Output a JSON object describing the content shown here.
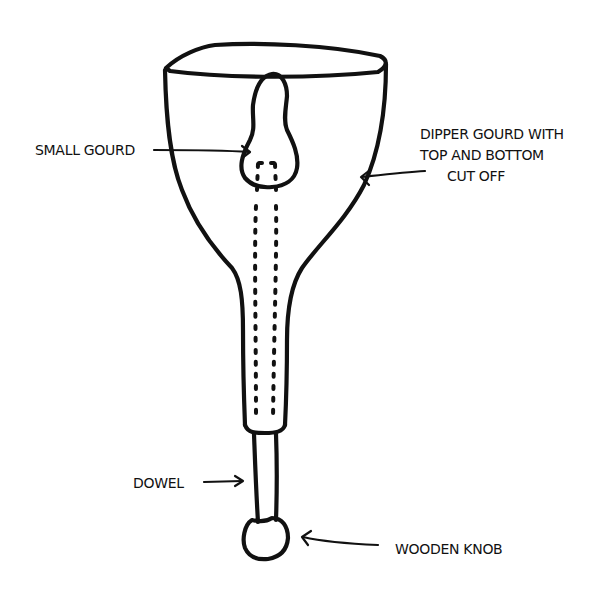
{
  "diagram": {
    "style": "hand-drawn black ink on white",
    "colors": {
      "ink": "#111111",
      "background": "#ffffff"
    },
    "labels": {
      "small_gourd": "SMALL GOURD",
      "dipper_gourd_line1": "DIPPER GOURD WITH",
      "dipper_gourd_line2": "TOP AND BOTTOM",
      "dipper_gourd_line3": "CUT OFF",
      "dowel": "DOWEL",
      "wooden_knob": "WOODEN KNOB"
    },
    "parts": [
      {
        "id": "dipper-gourd",
        "description": "Dipper gourd with top and bottom cut off"
      },
      {
        "id": "small-gourd",
        "description": "Small gourd inside the bowl"
      },
      {
        "id": "dowel",
        "description": "Dowel running through the neck (shown dotted inside)"
      },
      {
        "id": "wooden-knob",
        "description": "Wooden knob at the bottom end"
      }
    ]
  }
}
